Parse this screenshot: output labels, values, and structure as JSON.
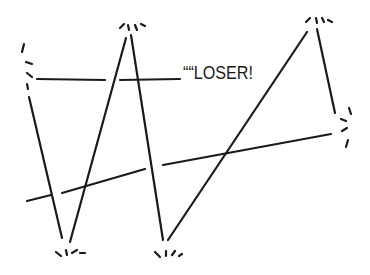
{
  "illustration": {
    "description": "Hand-drawn line sketch of a bouncing ball trajectory with zig-zag lines and impact marks",
    "caption": "““LOSER!",
    "stroke_color": "#1a1a1a",
    "background": "#ffffff"
  }
}
